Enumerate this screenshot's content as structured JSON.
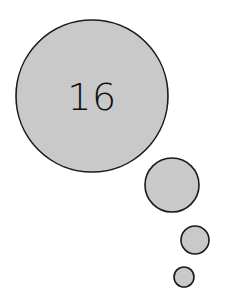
{
  "figure": {
    "background_color": "#ffffff",
    "fill_color": "#c9c9c9",
    "stroke_color": "#1a1a1a",
    "label_color": "#111111"
  },
  "chart_data": {
    "type": "scatter",
    "title": "",
    "xlabel": "",
    "ylabel": "",
    "grid": false,
    "legend": null,
    "xlim": [
      0,
      225
    ],
    "ylim": [
      0,
      308
    ],
    "note": "Four filled circles of decreasing radius arranged along a diagonal from upper-left to lower-right; the largest circle carries the numeric label.",
    "categories": [
      "circle-1",
      "circle-2",
      "circle-3",
      "circle-4"
    ],
    "values": [
      76,
      27,
      14,
      10
    ],
    "series": [
      {
        "name": "radius",
        "values": [
          76,
          27,
          14,
          10
        ]
      },
      {
        "name": "center_x",
        "values": [
          92,
          172,
          195,
          184
        ]
      },
      {
        "name": "center_y",
        "values": [
          96,
          185,
          240,
          277
        ]
      }
    ],
    "labels": [
      "16",
      "",
      "",
      ""
    ]
  },
  "circles": [
    {
      "name": "circle-large",
      "cx": 92,
      "cy": 96,
      "r": 76,
      "label": "16",
      "label_x": 92,
      "label_y": 99,
      "label_size": 38
    },
    {
      "name": "circle-medium",
      "cx": 172,
      "cy": 185,
      "r": 27,
      "label": "",
      "label_x": 172,
      "label_y": 185,
      "label_size": 0
    },
    {
      "name": "circle-small",
      "cx": 195,
      "cy": 240,
      "r": 14,
      "label": "",
      "label_x": 195,
      "label_y": 240,
      "label_size": 0
    },
    {
      "name": "circle-tiny",
      "cx": 184,
      "cy": 277,
      "r": 10,
      "label": "",
      "label_x": 184,
      "label_y": 277,
      "label_size": 0
    }
  ]
}
